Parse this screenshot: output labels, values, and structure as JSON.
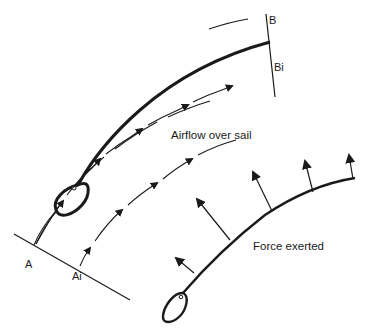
{
  "diagram": {
    "top_panel": {
      "caption": "Airflow over sail",
      "labels": {
        "point_a": "A",
        "point_a1": "Ai",
        "point_b": "B",
        "point_b1": "Bi"
      }
    },
    "bottom_panel": {
      "caption": "Force exerted"
    },
    "colors": {
      "ink": "#1a1a1a",
      "background": "#ffffff"
    }
  }
}
